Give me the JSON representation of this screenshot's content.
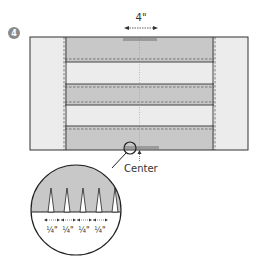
{
  "step": {
    "number": "4"
  },
  "labels": {
    "width_measure": "4\"",
    "center": "Center",
    "quarter_marks": [
      "¼\"",
      "¼\"",
      "¼\"",
      "¼\""
    ]
  },
  "colors": {
    "dark_fill": "#c8c8c8",
    "light_fill": "#ececec",
    "outline": "#333333",
    "badge": "#8a8a8a"
  },
  "figure": {
    "stripes": [
      "dark",
      "light",
      "dark",
      "light",
      "dark"
    ],
    "side_panels": [
      "left",
      "right"
    ]
  }
}
